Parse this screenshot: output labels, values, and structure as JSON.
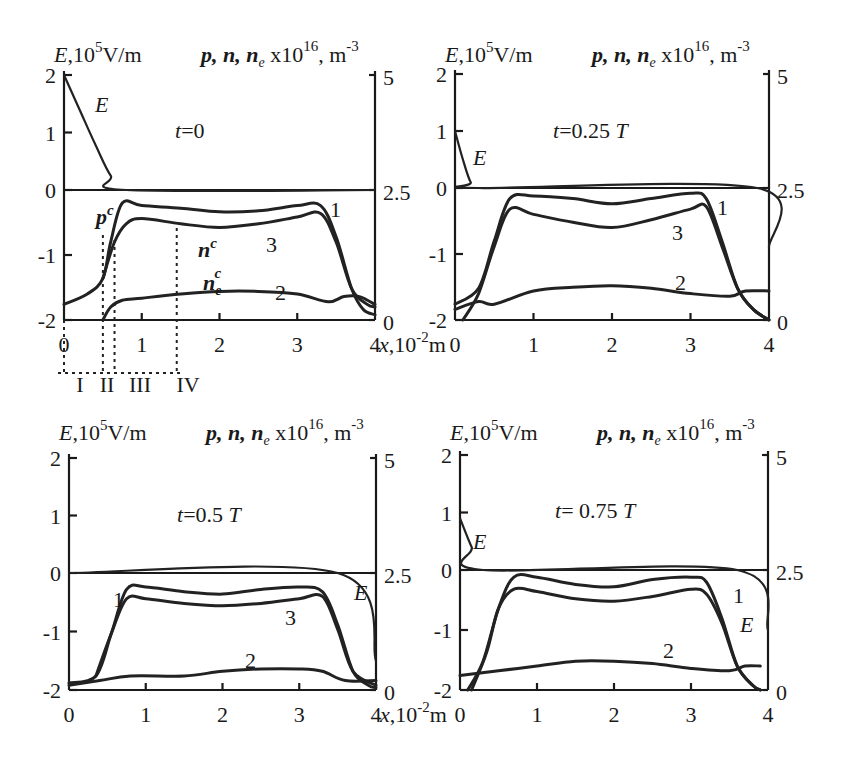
{
  "figure": {
    "left_axis_label": "E,10⁵V/m",
    "right_axis_label": "p, n, nₑ x10¹⁶, m⁻³",
    "x_axis_label": "x,10⁻²m",
    "region_labels": [
      "I",
      "II",
      "III",
      "IV"
    ],
    "region_boundaries_x": [
      0,
      0.5,
      0.65,
      1.45
    ],
    "curve_labels": {
      "p": "1",
      "ne": "2",
      "n": "3",
      "E": "E"
    },
    "annotations_panel1": {
      "pc": "pᶜ",
      "nc": "nᶜ",
      "nec": "nₑᶜ"
    }
  },
  "chart_data": [
    {
      "type": "line",
      "title": "t=0",
      "xlabel": "x, 10^-2 m",
      "ylabel_left": "E, 10^5 V/m",
      "ylabel_right": "p, n, n_e x10^16, m^-3",
      "xlim": [
        0,
        4
      ],
      "ylim_left": [
        -2,
        2
      ],
      "ylim_right": [
        0,
        5
      ],
      "x_ticks": [
        "0",
        "1",
        "2",
        "3",
        "4"
      ],
      "y_ticks_left": [
        "-2",
        "-1",
        "0",
        "1",
        "2"
      ],
      "y_ticks_right": [
        "0",
        "2.5",
        "5"
      ],
      "series": [
        {
          "name": "E",
          "axis": "left",
          "x": [
            0,
            0.2,
            0.4,
            0.6,
            0.8,
            4.0
          ],
          "values": [
            2.0,
            1.4,
            0.8,
            0.25,
            0.0,
            0.0
          ]
        },
        {
          "name": "1 (p)",
          "axis": "right",
          "x": [
            0,
            0.3,
            0.5,
            0.6,
            0.75,
            1.0,
            1.5,
            2.0,
            2.5,
            3.0,
            3.3,
            3.5,
            3.7,
            3.85,
            4.0
          ],
          "values": [
            0.3,
            0.5,
            0.8,
            1.5,
            2.25,
            2.2,
            2.15,
            2.08,
            2.1,
            2.2,
            2.2,
            1.6,
            0.6,
            0.2,
            0.1
          ]
        },
        {
          "name": "3 (n)",
          "axis": "right",
          "x": [
            0.5,
            0.65,
            0.8,
            1.0,
            1.5,
            2.0,
            2.5,
            3.0,
            3.3,
            3.5,
            3.7,
            3.9,
            4.0
          ],
          "values": [
            0.8,
            1.5,
            1.85,
            1.95,
            1.85,
            1.78,
            1.85,
            1.98,
            2.05,
            1.5,
            0.6,
            0.3,
            0.25
          ]
        },
        {
          "name": "2 (n_e)",
          "axis": "right",
          "x": [
            0.5,
            0.6,
            0.75,
            1.0,
            1.5,
            2.0,
            2.5,
            3.0,
            3.4,
            3.6,
            3.8,
            4.0
          ],
          "values": [
            0.0,
            0.25,
            0.38,
            0.42,
            0.5,
            0.55,
            0.55,
            0.5,
            0.35,
            0.45,
            0.45,
            0.3
          ]
        }
      ]
    },
    {
      "type": "line",
      "title": "t =0.25 T",
      "xlabel": "x, 10^-2 m",
      "xlim": [
        0,
        4
      ],
      "ylim_left": [
        -2,
        2
      ],
      "ylim_right": [
        0,
        5
      ],
      "x_ticks": [
        "0",
        "1",
        "2",
        "3",
        "4"
      ],
      "y_ticks_left": [
        "-2",
        "-1",
        "0",
        "1",
        "2"
      ],
      "y_ticks_right": [
        "0",
        "2.5",
        "5"
      ],
      "series": [
        {
          "name": "E",
          "axis": "left",
          "x": [
            0,
            0.1,
            0.2,
            0.3,
            3.85,
            4.0
          ],
          "values": [
            1.0,
            0.5,
            0.1,
            0.0,
            0.0,
            -0.9
          ]
        },
        {
          "name": "1 (p)",
          "axis": "right",
          "x": [
            0,
            0.3,
            0.5,
            0.7,
            1.0,
            1.5,
            2.0,
            2.5,
            3.0,
            3.2,
            3.4,
            3.6,
            3.8,
            4.0
          ],
          "values": [
            0.3,
            0.6,
            1.5,
            2.3,
            2.35,
            2.3,
            2.2,
            2.3,
            2.4,
            2.3,
            1.5,
            0.6,
            0.2,
            0.0
          ]
        },
        {
          "name": "3 (n)",
          "axis": "right",
          "x": [
            0.1,
            0.3,
            0.5,
            0.7,
            1.0,
            1.5,
            2.0,
            2.5,
            3.0,
            3.2,
            3.4,
            3.6,
            3.8,
            4.0
          ],
          "values": [
            0.0,
            0.5,
            1.4,
            2.1,
            2.0,
            1.85,
            1.75,
            1.9,
            2.1,
            2.15,
            1.4,
            0.6,
            0.2,
            0.0
          ]
        },
        {
          "name": "2 (n_e)",
          "axis": "right",
          "x": [
            0,
            0.3,
            0.5,
            1.0,
            1.5,
            2.0,
            2.5,
            3.0,
            3.5,
            3.7,
            4.0
          ],
          "values": [
            0.2,
            0.35,
            0.3,
            0.55,
            0.62,
            0.65,
            0.6,
            0.5,
            0.45,
            0.55,
            0.55
          ]
        }
      ]
    },
    {
      "type": "line",
      "title": "t=0.5 T",
      "xlabel": "x, 10^-2 m",
      "xlim": [
        0,
        4
      ],
      "ylim_left": [
        -2,
        2
      ],
      "ylim_right": [
        0,
        5
      ],
      "x_ticks": [
        "0",
        "1",
        "2",
        "3",
        "4"
      ],
      "y_ticks_left": [
        "-2",
        "-1",
        "0",
        "1",
        "2"
      ],
      "y_ticks_right": [
        "0",
        "2.5",
        "5"
      ],
      "series": [
        {
          "name": "E",
          "axis": "left",
          "x": [
            0,
            3.5,
            4.0
          ],
          "values": [
            0.0,
            0.0,
            -1.5
          ]
        },
        {
          "name": "1 (p)",
          "axis": "right",
          "x": [
            0,
            0.35,
            0.55,
            0.75,
            1.0,
            1.5,
            2.0,
            2.5,
            3.0,
            3.3,
            3.5,
            3.7,
            3.9,
            4.0
          ],
          "values": [
            0.15,
            0.3,
            1.2,
            2.15,
            2.2,
            2.1,
            2.05,
            2.15,
            2.2,
            2.1,
            1.4,
            0.4,
            0.1,
            0.05
          ]
        },
        {
          "name": "3 (n)",
          "axis": "right",
          "x": [
            0.35,
            0.55,
            0.75,
            1.0,
            1.5,
            2.0,
            2.5,
            3.0,
            3.3,
            3.5,
            3.7,
            4.0
          ],
          "values": [
            0.3,
            1.2,
            1.95,
            1.95,
            1.85,
            1.8,
            1.85,
            1.95,
            2.0,
            1.3,
            0.4,
            0.1
          ]
        },
        {
          "name": "2 (n_e)",
          "axis": "right",
          "x": [
            0,
            0.4,
            0.8,
            1.5,
            2.0,
            2.5,
            3.0,
            3.3,
            3.6,
            4.0
          ],
          "values": [
            0.1,
            0.2,
            0.3,
            0.3,
            0.4,
            0.45,
            0.45,
            0.4,
            0.2,
            0.2
          ]
        }
      ]
    },
    {
      "type": "line",
      "title": "t= 0.75 T",
      "xlabel": "x, 10^-2 m",
      "xlim": [
        0,
        4
      ],
      "ylim_left": [
        -2,
        2
      ],
      "ylim_right": [
        0,
        5
      ],
      "x_ticks": [
        "0",
        "1",
        "2",
        "3",
        "4"
      ],
      "y_ticks_left": [
        "-2",
        "-1",
        "0",
        "1",
        "2"
      ],
      "y_ticks_right": [
        "0",
        "2.5",
        "5"
      ],
      "series": [
        {
          "name": "E",
          "axis": "left",
          "x": [
            0,
            0.15,
            0.3,
            3.6,
            4.0
          ],
          "values": [
            0.9,
            0.4,
            0.0,
            0.0,
            -1.0
          ]
        },
        {
          "name": "1 (p)",
          "axis": "right",
          "x": [
            0.1,
            0.3,
            0.5,
            0.7,
            1.0,
            1.5,
            2.0,
            2.5,
            3.0,
            3.2,
            3.4,
            3.6,
            3.8,
            3.9
          ],
          "values": [
            0.0,
            0.6,
            1.7,
            2.35,
            2.35,
            2.2,
            2.15,
            2.3,
            2.35,
            2.25,
            1.5,
            0.5,
            0.1,
            0.0
          ]
        },
        {
          "name": "3 (n)",
          "axis": "right",
          "x": [
            0.15,
            0.35,
            0.5,
            0.7,
            1.0,
            1.5,
            2.0,
            2.5,
            3.0,
            3.2,
            3.4,
            3.6,
            3.8,
            3.9
          ],
          "values": [
            0.0,
            0.8,
            1.7,
            2.1,
            2.05,
            1.9,
            1.85,
            1.95,
            2.1,
            2.0,
            1.4,
            0.5,
            0.1,
            0.0
          ]
        },
        {
          "name": "2 (n_e)",
          "axis": "right",
          "x": [
            0,
            0.5,
            1.0,
            1.5,
            2.0,
            2.5,
            3.0,
            3.5,
            3.7,
            3.9
          ],
          "values": [
            0.3,
            0.4,
            0.5,
            0.6,
            0.6,
            0.55,
            0.45,
            0.4,
            0.5,
            0.5
          ]
        }
      ]
    }
  ]
}
